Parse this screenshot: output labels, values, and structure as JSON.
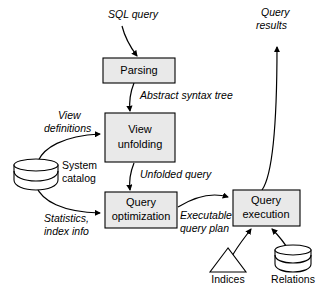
{
  "diagram": {
    "colors": {
      "process_fill": "#e9e9e9",
      "store_fill": "#ffffff",
      "stroke": "#000000",
      "background": "#ffffff"
    },
    "processes": [
      {
        "id": "parsing",
        "label": "Parsing",
        "label_line1": "Parsing",
        "label_line2": ""
      },
      {
        "id": "view-unfolding",
        "label": "View unfolding",
        "label_line1": "View",
        "label_line2": "unfolding"
      },
      {
        "id": "query-optimization",
        "label": "Query optimization",
        "label_line1": "Query",
        "label_line2": "optimization"
      },
      {
        "id": "query-execution",
        "label": "Query execution",
        "label_line1": "Query",
        "label_line2": "execution"
      }
    ],
    "data_stores": [
      {
        "id": "system-catalog",
        "label": "System catalog",
        "label_line1": "System",
        "label_line2": "catalog",
        "shape": "cylinder"
      },
      {
        "id": "indices",
        "label": "Indices",
        "shape": "triangle"
      },
      {
        "id": "relations",
        "label": "Relations",
        "shape": "cylinder"
      }
    ],
    "flow_labels": [
      {
        "id": "sql-query",
        "label": "SQL query",
        "line1": "SQL query",
        "line2": ""
      },
      {
        "id": "query-results",
        "label": "Query results",
        "line1": "Query",
        "line2": "results"
      },
      {
        "id": "abstract-syntax-tree",
        "label": "Abstract syntax tree",
        "line1": "Abstract syntax tree",
        "line2": ""
      },
      {
        "id": "view-definitions",
        "label": "View definitions",
        "line1": "View",
        "line2": "definitions"
      },
      {
        "id": "unfolded-query",
        "label": "Unfolded query",
        "line1": "Unfolded query",
        "line2": ""
      },
      {
        "id": "statistics-index-info",
        "label": "Statistics, index info",
        "line1": "Statistics,",
        "line2": "index info"
      },
      {
        "id": "executable-query-plan",
        "label": "Executable query plan",
        "line1": "Executable",
        "line2": "query plan"
      }
    ]
  }
}
